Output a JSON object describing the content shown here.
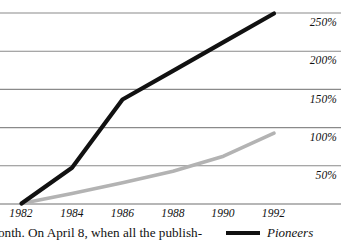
{
  "chart_data": {
    "type": "line",
    "title": "",
    "subtitle": "",
    "xlabel": "",
    "ylabel": "",
    "grid": true,
    "legend_position": "below-right",
    "x": [
      1982,
      1984,
      1986,
      1988,
      1990,
      1992
    ],
    "x_tick_labels": [
      "1982",
      "1984",
      "1986",
      "1988",
      "1990",
      "1992"
    ],
    "xlim": [
      1982,
      1992
    ],
    "y_tick_labels": [
      "250%",
      "200%",
      "150%",
      "100%",
      "50%"
    ],
    "y_tick_values": [
      250,
      200,
      150,
      100,
      50
    ],
    "ylim": [
      0,
      300
    ],
    "series": [
      {
        "name": "Pioneers",
        "color": "#111111",
        "points": [
          {
            "x": 1982,
            "y": 0
          },
          {
            "x": 1984,
            "y": 50
          },
          {
            "x": 1986,
            "y": 145
          },
          {
            "x": 1988,
            "y": 185
          },
          {
            "x": 1990,
            "y": 225
          },
          {
            "x": 1992,
            "y": 265
          }
        ],
        "values": [
          0,
          50,
          145,
          185,
          225,
          265
        ]
      },
      {
        "name": "second-series",
        "color": "#b3b3b3",
        "points": [
          {
            "x": 1982,
            "y": 0
          },
          {
            "x": 1984,
            "y": 14
          },
          {
            "x": 1986,
            "y": 29
          },
          {
            "x": 1988,
            "y": 45
          },
          {
            "x": 1990,
            "y": 66
          },
          {
            "x": 1992,
            "y": 98
          }
        ],
        "values": [
          0,
          14,
          29,
          45,
          66,
          98
        ]
      }
    ]
  },
  "y_axis": {
    "ticks": [
      {
        "label": "250%"
      },
      {
        "label": "200%"
      },
      {
        "label": "150%"
      },
      {
        "label": "100%"
      },
      {
        "label": "50%"
      }
    ]
  },
  "x_axis": {
    "ticks": [
      {
        "label": "1982"
      },
      {
        "label": "1984"
      },
      {
        "label": "1986"
      },
      {
        "label": "1988"
      },
      {
        "label": "1990"
      },
      {
        "label": "1992"
      }
    ]
  },
  "caption": {
    "body_text": "onth. On April 8, when all the publish-"
  },
  "legend": {
    "entries": [
      {
        "label": "Pioneers",
        "color": "#111111"
      }
    ]
  },
  "colors": {
    "series_primary": "#111111",
    "series_secondary": "#b3b3b3",
    "gridline": "#8a8a8a",
    "text": "#111111",
    "background": "#ffffff"
  }
}
